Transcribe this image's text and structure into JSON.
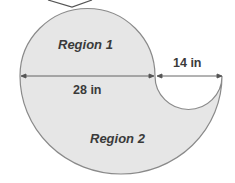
{
  "diagram": {
    "type": "composite-shape",
    "regions": [
      {
        "id": "region1",
        "label": "Region 1"
      },
      {
        "id": "region2",
        "label": "Region 2"
      }
    ],
    "dimensions": [
      {
        "id": "large-diameter",
        "label": "28 in"
      },
      {
        "id": "small-diameter",
        "label": "14 in"
      }
    ],
    "colors": {
      "fill": "#e6e6e6",
      "stroke": "#8a8a8a",
      "dimension_line": "#555555",
      "text": "#3a3a3a"
    }
  }
}
